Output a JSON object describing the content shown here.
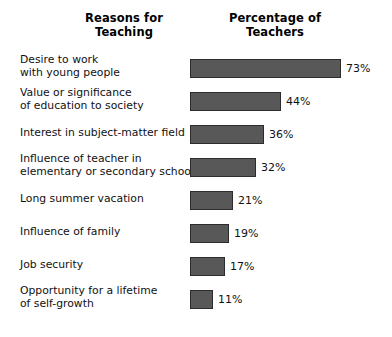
{
  "headers": {
    "left": {
      "line1": "Reasons for",
      "line2": "Teaching"
    },
    "right": {
      "line1": "Percentage of",
      "line2": "Teachers"
    }
  },
  "chart_data": {
    "type": "bar",
    "orientation": "horizontal",
    "title": "Reasons for Teaching",
    "xlabel": "Percentage of Teachers",
    "ylabel": "Reasons for Teaching",
    "grid": false,
    "legend": null,
    "xlim": [
      0,
      73
    ],
    "value_suffix": "%",
    "bar_color": "#585858",
    "bar_border_color": "#2c2c2c",
    "background_color": "#ffffff",
    "text_color": "#111111",
    "categories": [
      "Desire to work with young people",
      "Value or significance of education to society",
      "Interest in subject-matter field",
      "Influence of teacher in elementary or secondary school",
      "Long summer vacation",
      "Influence of family",
      "Job security",
      "Opportunity for a lifetime of self-growth"
    ],
    "values": [
      73,
      44,
      36,
      32,
      21,
      19,
      17,
      11
    ],
    "value_labels": [
      "73%",
      "44%",
      "36%",
      "32%",
      "21%",
      "19%",
      "17%",
      "11%"
    ]
  },
  "rows": [
    {
      "label_line1": "Desire to work",
      "label_line2": "with young people",
      "value": 73,
      "value_label": "73%"
    },
    {
      "label_line1": "Value or significance",
      "label_line2": "of education to society",
      "value": 44,
      "value_label": "44%"
    },
    {
      "label_line1": "Interest in subject-matter field",
      "label_line2": "",
      "value": 36,
      "value_label": "36%"
    },
    {
      "label_line1": "Influence of teacher in",
      "label_line2": "elementary or secondary school",
      "value": 32,
      "value_label": "32%"
    },
    {
      "label_line1": "Long summer vacation",
      "label_line2": "",
      "value": 21,
      "value_label": "21%"
    },
    {
      "label_line1": "Influence of family",
      "label_line2": "",
      "value": 19,
      "value_label": "19%"
    },
    {
      "label_line1": "Job security",
      "label_line2": "",
      "value": 17,
      "value_label": "17%"
    },
    {
      "label_line1": "Opportunity for a lifetime",
      "label_line2": "of self-growth",
      "value": 11,
      "value_label": "11%"
    }
  ]
}
